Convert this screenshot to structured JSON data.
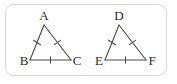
{
  "figure": {
    "caption": "Two congruent triangles with tick marks on corresponding sides",
    "background_color": "#ffffff",
    "frame": {
      "border_color": "#d8d8d8",
      "corner_radius": "9px",
      "style": "rounded-rectangle"
    },
    "stroke_color": "#4a4a4a",
    "label_color": "#2b2b2b",
    "triangles": [
      {
        "name": "triangle-abc",
        "vertices": [
          {
            "label": "A",
            "x": 44,
            "y": 25,
            "label_x": 44,
            "label_y": 20
          },
          {
            "label": "B",
            "x": 30,
            "y": 60,
            "label_x": 24,
            "label_y": 64
          },
          {
            "label": "C",
            "x": 71,
            "y": 60,
            "label_x": 76,
            "label_y": 64
          }
        ],
        "sides": [
          {
            "name": "side-ab",
            "from": "A",
            "to": "B",
            "ticks": 1
          },
          {
            "name": "side-ac",
            "from": "A",
            "to": "C",
            "ticks": 1
          },
          {
            "name": "side-bc",
            "from": "B",
            "to": "C",
            "ticks": 1
          }
        ]
      },
      {
        "name": "triangle-def",
        "vertices": [
          {
            "label": "D",
            "x": 119,
            "y": 25,
            "label_x": 119,
            "label_y": 20
          },
          {
            "label": "E",
            "x": 105,
            "y": 60,
            "label_x": 99,
            "label_y": 64
          },
          {
            "label": "F",
            "x": 146,
            "y": 60,
            "label_x": 151,
            "label_y": 64
          }
        ],
        "sides": [
          {
            "name": "side-de",
            "from": "D",
            "to": "E",
            "ticks": 1
          },
          {
            "name": "side-df",
            "from": "D",
            "to": "F",
            "ticks": 1
          },
          {
            "name": "side-ef",
            "from": "E",
            "to": "F",
            "ticks": 1
          }
        ]
      }
    ],
    "labels": {
      "a": "A",
      "b": "B",
      "c": "C",
      "d": "D",
      "e": "E",
      "f": "F"
    }
  }
}
